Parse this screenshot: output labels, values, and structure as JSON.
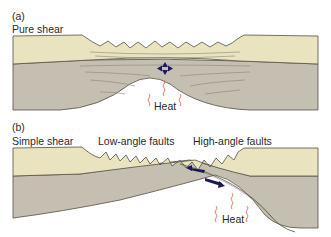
{
  "panels": [
    {
      "id": "a",
      "tag": "(a)",
      "title": "Pure shear",
      "heat_label": "Heat"
    },
    {
      "id": "b",
      "tag": "(b)",
      "title": "Simple shear",
      "fault_labels": [
        "Low-angle faults",
        "High-angle faults"
      ],
      "heat_label": "Heat"
    }
  ],
  "colors": {
    "upper_crust": "#e9e4bf",
    "lower_crust": "#c4bfb0",
    "outline": "#555046",
    "strain_lines": "#8a857a",
    "arrows": "#1e1a5a",
    "heat": "#e0705a"
  }
}
